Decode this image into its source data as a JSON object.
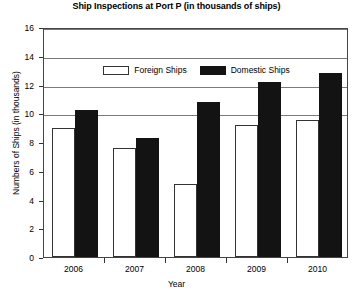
{
  "chart_data": {
    "type": "bar",
    "title": "Ship Inspections at Port P (in thousands of ships)",
    "xlabel": "Year",
    "ylabel": "Numbers of Ships (in thousands)",
    "categories": [
      "2006",
      "2007",
      "2008",
      "2009",
      "2010"
    ],
    "series": [
      {
        "name": "Foreign Ships",
        "color": "#ffffff",
        "values": [
          9.0,
          7.6,
          5.1,
          9.2,
          9.5
        ]
      },
      {
        "name": "Domestic Ships",
        "color": "#131313",
        "values": [
          10.2,
          8.3,
          10.8,
          12.2,
          12.8
        ]
      }
    ],
    "ylim": [
      0,
      16
    ],
    "yticks": [
      0,
      2,
      4,
      6,
      8,
      10,
      12,
      14,
      16
    ],
    "gridlines": [
      10,
      12,
      14,
      16
    ],
    "grid": true,
    "legend_position": "top-center"
  }
}
